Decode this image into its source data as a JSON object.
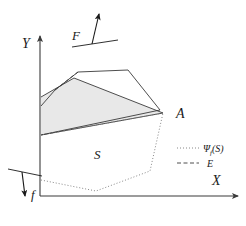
{
  "figure": {
    "title": "",
    "background_color": "#ffffff",
    "stroke_color": "#3a3a3a",
    "axis_color": "#3a3a3a",
    "shade_color": "#e8e8e8"
  },
  "axes": {
    "x_label": "X",
    "y_label": "Y",
    "origin": {
      "x": 40,
      "y": 196
    },
    "x_end": {
      "x": 238,
      "y": 196
    },
    "y_top": {
      "x": 40,
      "y": 36
    }
  },
  "labels": {
    "point_a": "A",
    "region_s": "S",
    "force_f_upper": "F",
    "force_f_lower": "f"
  },
  "legend": {
    "items": [
      {
        "name": "psi-s",
        "label": "Ψ",
        "subscript": "f",
        "suffix": "(S)",
        "line_style": "dotted"
      },
      {
        "name": "e-set",
        "label": "E",
        "subscript": "",
        "suffix": "",
        "line_style": "dashed"
      }
    ]
  },
  "shapes": {
    "solid_polygon_points": "41,106 55,90 78,72 128,70 160,110 41,135",
    "shaded_polygon_points": "41,97 74,78 163,113 41,135",
    "dotted_polygon_points": "41,180 96,191 150,171 163,113 41,135",
    "dashed_segment_points": "55,90 78,72",
    "vector_f_base": {
      "x1": 72,
      "y1": 47,
      "x2": 118,
      "y2": 40
    },
    "vector_f_shaft": {
      "x1": 92,
      "y1": 44,
      "x2": 99,
      "y2": 14
    },
    "vector_f_lower_base": {
      "x1": 8,
      "y1": 169,
      "x2": 42,
      "y2": 176
    },
    "vector_f_lower_shaft": {
      "x1": 22,
      "y1": 172,
      "x2": 25,
      "y2": 196
    }
  },
  "chart_data": {
    "type": "diagram",
    "elements": [
      "y-axis",
      "x-axis",
      "solid-polygon",
      "shaded-polygon",
      "dotted-polygon",
      "dashed-segment",
      "vector-F",
      "vector-f",
      "vertex-A",
      "label-S",
      "legend"
    ]
  }
}
